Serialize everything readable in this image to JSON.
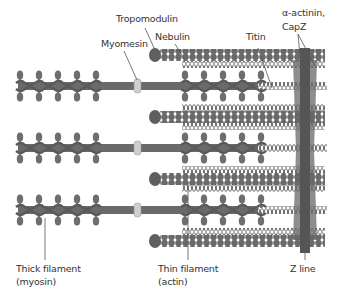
{
  "labels": {
    "tropomodulin": "Tropomodulin",
    "nebulin": "Nebulin",
    "myomesin": "Myomesin",
    "titin": "Titin",
    "alpha_actinin_line1": "α-actinin,",
    "alpha_actinin_line2": "CapZ",
    "thick_filament_line1": "Thick filament",
    "thick_filament_line2": "(myosin)",
    "thin_filament_line1": "Thin filament",
    "thin_filament_line2": "(actin)",
    "z_line": "Z line"
  },
  "colors": {
    "filament_dark": "#5a5a5a",
    "filament_mid": "#7a7a7a",
    "z_disc_dark": "#555555",
    "z_disc_light": "#8e8e8e",
    "myomesin_fill": "#cfcfcf",
    "leader_line": "#555555",
    "text": "#333333"
  },
  "layout": {
    "thick_filament_rows_y": [
      86,
      148,
      210
    ],
    "thin_filament_rows_y": [
      55,
      117,
      179,
      241
    ],
    "z_line_x": 305
  }
}
